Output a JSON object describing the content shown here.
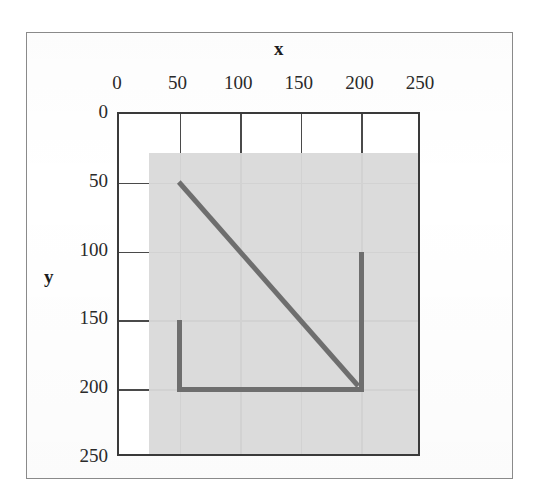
{
  "figure": {
    "frame_color": "#8a8a8a",
    "background": "#ffffff"
  },
  "chart_data": {
    "type": "line",
    "title": "",
    "xlabel": "x",
    "ylabel": "y",
    "xlim": [
      0,
      250
    ],
    "ylim": [
      0,
      250
    ],
    "y_axis_inverted": true,
    "grid": true,
    "legend": null,
    "x_ticks": [
      0,
      50,
      100,
      150,
      200,
      250
    ],
    "y_ticks": [
      0,
      50,
      100,
      150,
      200,
      250
    ],
    "x_tick_labels": [
      "0",
      "50",
      "100",
      "150",
      "200",
      "250"
    ],
    "y_tick_labels": [
      "0",
      "50",
      "100",
      "150",
      "200",
      "250"
    ],
    "region": {
      "name": "shaded-image-region",
      "x0": 25,
      "y0": 28,
      "x1": 250,
      "y1": 257,
      "color": "#d9d9d9"
    },
    "series": [
      {
        "name": "diagonal-line",
        "color": "#6e6e6e",
        "x": [
          50,
          200
        ],
        "y": [
          50,
          200
        ]
      },
      {
        "name": "left-vertical-line",
        "color": "#6e6e6e",
        "x": [
          50,
          50
        ],
        "y": [
          150,
          200
        ]
      },
      {
        "name": "bottom-horizontal-line",
        "color": "#6e6e6e",
        "x": [
          50,
          200
        ],
        "y": [
          200,
          200
        ]
      },
      {
        "name": "right-vertical-line",
        "color": "#6e6e6e",
        "x": [
          200,
          200
        ],
        "y": [
          100,
          200
        ]
      }
    ]
  }
}
